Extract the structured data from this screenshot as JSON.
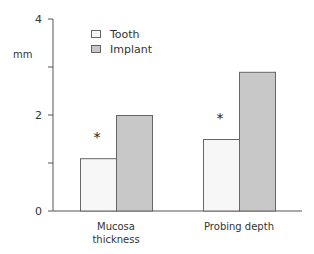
{
  "chart_data": {
    "type": "bar",
    "title": "",
    "xlabel": "",
    "ylabel": "mm",
    "ylim": [
      0,
      4
    ],
    "yticks": [
      0,
      1,
      2,
      3,
      4
    ],
    "ytick_labels": [
      "0",
      "",
      "2",
      "",
      "4"
    ],
    "categories": [
      "Mucosa thickness",
      "Probing depth"
    ],
    "category_label_lines": [
      [
        "Mucosa",
        "thickness"
      ],
      [
        "Probing depth"
      ]
    ],
    "series": [
      {
        "name": "Tooth",
        "values": [
          1.1,
          1.5
        ],
        "color": "#f7f7f7"
      },
      {
        "name": "Implant",
        "values": [
          2.0,
          2.9
        ],
        "color": "#c8c8c8"
      }
    ],
    "annotations": [
      {
        "text": "*",
        "category": "Mucosa thickness",
        "note": "significance marker"
      },
      {
        "text": "*",
        "category": "Probing depth",
        "note": "significance marker"
      }
    ],
    "grid": false,
    "legend_position": "upper-left-inside"
  }
}
